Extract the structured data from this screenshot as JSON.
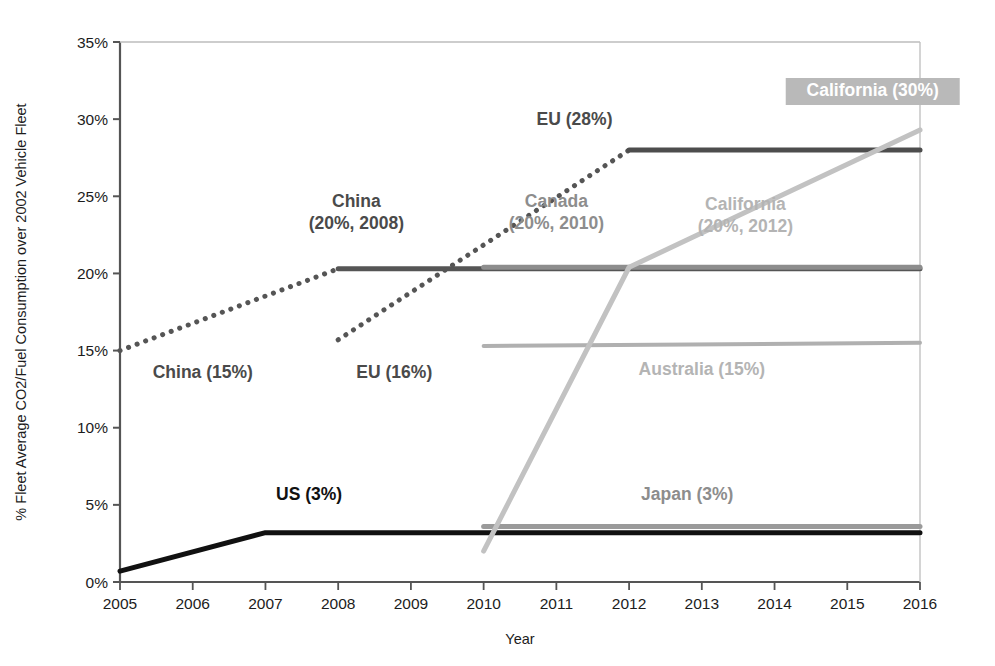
{
  "chart_data": {
    "type": "line",
    "title": "",
    "xlabel": "Year",
    "ylabel": "% Fleet Average CO2/Fuel Consumption over 2002 Vehicle Fleet",
    "xlim": [
      2005,
      2016
    ],
    "ylim": [
      0,
      35
    ],
    "ytick_labels": [
      "0%",
      "5%",
      "10%",
      "15%",
      "20%",
      "25%",
      "30%",
      "35%"
    ],
    "ytick_values": [
      0,
      5,
      10,
      15,
      20,
      25,
      30,
      35
    ],
    "xtick_labels": [
      "2005",
      "2006",
      "2007",
      "2008",
      "2009",
      "2010",
      "2011",
      "2012",
      "2013",
      "2014",
      "2015",
      "2016"
    ],
    "xtick_values": [
      2005,
      2006,
      2007,
      2008,
      2009,
      2010,
      2011,
      2012,
      2013,
      2014,
      2015,
      2016
    ],
    "grid": false,
    "legend_position": "inline-annotations",
    "series": [
      {
        "name": "US",
        "color": "#111111",
        "style": "solid",
        "width": 5,
        "x": [
          2005,
          2007,
          2016
        ],
        "y": [
          0.7,
          3.2,
          3.2
        ]
      },
      {
        "name": "China (dotted ramp)",
        "color": "#555555",
        "style": "dotted",
        "width": 5,
        "x": [
          2005,
          2008
        ],
        "y": [
          15.0,
          20.3
        ]
      },
      {
        "name": "China (target plateau)",
        "color": "#555555",
        "style": "solid",
        "width": 5,
        "x": [
          2008,
          2016
        ],
        "y": [
          20.3,
          20.3
        ]
      },
      {
        "name": "EU (dotted ramp)",
        "color": "#555555",
        "style": "dotted",
        "width": 5,
        "x": [
          2008,
          2012
        ],
        "y": [
          15.7,
          28.0
        ]
      },
      {
        "name": "EU (target plateau)",
        "color": "#4d4d4d",
        "style": "solid",
        "width": 5,
        "x": [
          2012,
          2016
        ],
        "y": [
          28.0,
          28.0
        ]
      },
      {
        "name": "Canada",
        "color": "#8d8d8d",
        "style": "solid",
        "width": 5,
        "x": [
          2010,
          2016
        ],
        "y": [
          20.4,
          20.4
        ]
      },
      {
        "name": "Australia",
        "color": "#b0b0b0",
        "style": "solid",
        "width": 4,
        "x": [
          2010,
          2016
        ],
        "y": [
          15.3,
          15.5
        ]
      },
      {
        "name": "Japan",
        "color": "#9a9a9a",
        "style": "solid",
        "width": 5,
        "x": [
          2010,
          2016
        ],
        "y": [
          3.6,
          3.6
        ]
      },
      {
        "name": "California",
        "color": "#c2c2c2",
        "style": "solid",
        "width": 5,
        "x": [
          2010,
          2012,
          2016
        ],
        "y": [
          2.0,
          20.4,
          29.3
        ]
      }
    ],
    "annotations": [
      {
        "id": "china-15",
        "text": "China (15%)",
        "lines": [
          "China (15%)"
        ],
        "x": 2005.45,
        "y": 13.2,
        "tone": "dark",
        "anchor": "start",
        "highlight": false
      },
      {
        "id": "china-20",
        "text": "China (20%, 2008)",
        "lines": [
          "China",
          "(20%, 2008)"
        ],
        "x": 2008.25,
        "y": 24.3,
        "tone": "dark",
        "anchor": "middle",
        "highlight": false
      },
      {
        "id": "eu-16",
        "text": "EU (16%)",
        "lines": [
          "EU (16%)"
        ],
        "x": 2008.25,
        "y": 13.2,
        "tone": "dark",
        "anchor": "start",
        "highlight": false
      },
      {
        "id": "eu-28",
        "text": "EU (28%)",
        "lines": [
          "EU (28%)"
        ],
        "x": 2011.25,
        "y": 29.6,
        "tone": "dark",
        "anchor": "middle",
        "highlight": false
      },
      {
        "id": "canada-20",
        "text": "Canada (20%, 2010)",
        "lines": [
          "Canada",
          "(20%, 2010)"
        ],
        "x": 2011.0,
        "y": 24.3,
        "tone": "mid",
        "anchor": "middle",
        "highlight": false
      },
      {
        "id": "california-20",
        "text": "California (20%, 2012)",
        "lines": [
          "California",
          "(20%, 2012)"
        ],
        "x": 2013.6,
        "y": 24.1,
        "tone": "light",
        "anchor": "middle",
        "highlight": false
      },
      {
        "id": "california-30",
        "text": "California (30%)",
        "lines": [
          "California (30%)"
        ],
        "x": 2015.35,
        "y": 31.5,
        "tone": "highlight",
        "anchor": "middle",
        "highlight": true
      },
      {
        "id": "australia-15",
        "text": "Australia (15%)",
        "lines": [
          "Australia (15%)"
        ],
        "x": 2013.0,
        "y": 13.4,
        "tone": "light",
        "anchor": "middle",
        "highlight": false
      },
      {
        "id": "us-3",
        "text": "US (3%)",
        "lines": [
          "US (3%)"
        ],
        "x": 2007.6,
        "y": 5.3,
        "tone": "black",
        "anchor": "middle",
        "highlight": false
      },
      {
        "id": "japan-3",
        "text": "Japan (3%)",
        "lines": [
          "Japan (3%)"
        ],
        "x": 2012.8,
        "y": 5.3,
        "tone": "mid",
        "anchor": "middle",
        "highlight": false
      }
    ],
    "colors": {
      "axis": "#6a6a6a",
      "highlight_box": "#b9b9b9",
      "highlight_text": "#ffffff",
      "background": "#ffffff"
    }
  }
}
